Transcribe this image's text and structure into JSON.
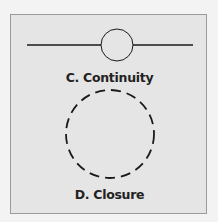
{
  "figure": {
    "panels": [
      {
        "id": "C",
        "label": "C. Continuity",
        "shape": "horizontal line passing through circle"
      },
      {
        "id": "D",
        "label": "D. Closure",
        "shape": "dashed circle"
      }
    ],
    "colors": {
      "background": "#f3f3f3",
      "panel": "#e5e5e5",
      "border": "#9a9a9a",
      "stroke": "#1a1a1a"
    }
  }
}
